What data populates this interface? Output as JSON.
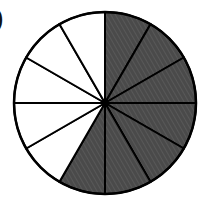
{
  "figure": {
    "label_fragment": ")",
    "total_parts": 12,
    "shaded_parts": 7,
    "unshaded_parts": 5,
    "shaded_start_clock_deg": 0,
    "shading_direction": "clockwise",
    "colors": {
      "shaded": "#4a4a4a",
      "unshaded": "#ffffff",
      "stroke": "#000000"
    }
  },
  "chart_data": {
    "type": "pie",
    "title": "",
    "categories": [
      "shaded",
      "unshaded"
    ],
    "values": [
      7,
      5
    ],
    "slices_equal": true,
    "slice_count": 12,
    "fraction_shaded": "7/12"
  }
}
